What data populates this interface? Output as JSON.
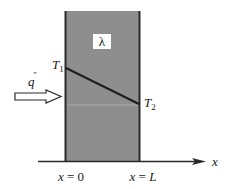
{
  "diagram": {
    "type": "plane-wall-conduction",
    "slab": {
      "fill_color": "#8e8e8e",
      "edge_color": "#2a2a2a",
      "conductivity_label": "λ"
    },
    "temperatures": {
      "left": {
        "symbol": "T",
        "subscript": "1"
      },
      "right": {
        "symbol": "T",
        "subscript": "2"
      }
    },
    "heat_flux": {
      "symbol": "q",
      "superscript": "″"
    },
    "axis": {
      "label": "x",
      "ticks": [
        {
          "label_var": "x",
          "label_eq": " = ",
          "label_val": "0"
        },
        {
          "label_var": "x",
          "label_eq": " = ",
          "label_val": "L"
        }
      ]
    },
    "colors": {
      "profile_line": "#1e1e1e",
      "axis": "#2a2a2a",
      "background": "#ffffff"
    }
  }
}
